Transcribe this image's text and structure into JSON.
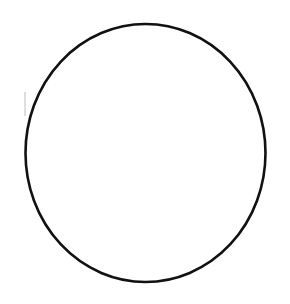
{
  "canvas": {
    "width": 290,
    "height": 304,
    "background": "#ffffff"
  },
  "shape": {
    "type": "ellipse",
    "cx": 145.5,
    "cy": 153,
    "rx": 120,
    "ry": 129,
    "stroke": "#111111",
    "stroke_width": 2.6,
    "fill": "none"
  },
  "stray_mark": {
    "x": 25,
    "y": 92,
    "height": 24,
    "color": "#c8c8c8"
  }
}
